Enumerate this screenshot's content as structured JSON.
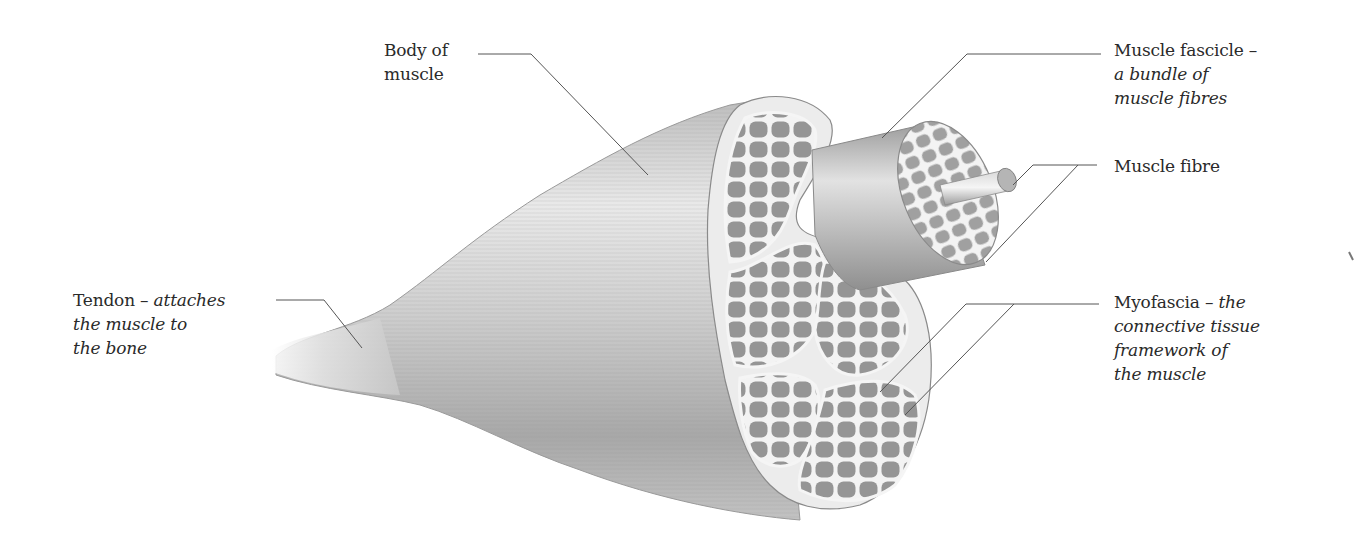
{
  "diagram": {
    "colors": {
      "background": "#ffffff",
      "text": "#2a2a2a",
      "leader_line": "#555555",
      "muscle_dark": "#8a8a8a",
      "muscle_light": "#e6e6e6",
      "fibre_fill": "#9c9c9c",
      "fascia": "#f1f1f1"
    },
    "labels": {
      "body": {
        "line1": "Body of",
        "line2": "muscle"
      },
      "fascicle": {
        "term": "Muscle fascicle –",
        "desc1": "a bundle of",
        "desc2": "muscle fibres"
      },
      "fibre": {
        "term": "Muscle fibre"
      },
      "tendon": {
        "term": "Tendon – ",
        "desc0": "attaches",
        "desc1": "the muscle to",
        "desc2": "the bone"
      },
      "myofascia": {
        "term": "Myofascia – ",
        "desc0": "the",
        "desc1": "connective tissue",
        "desc2": "framework of",
        "desc3": "the muscle"
      }
    },
    "leaders": [
      {
        "name": "body-leader",
        "points": [
          [
            478,
            54
          ],
          [
            531,
            54
          ],
          [
            648,
            175
          ]
        ]
      },
      {
        "name": "fascicle-leader",
        "points": [
          [
            1101,
            54
          ],
          [
            967,
            54
          ],
          [
            882,
            138
          ]
        ]
      },
      {
        "name": "fibre-leader-a",
        "points": [
          [
            1097,
            165
          ],
          [
            1033,
            165
          ],
          [
            1013,
            185
          ]
        ]
      },
      {
        "name": "fibre-leader-b",
        "points": [
          [
            1078,
            165
          ],
          [
            986,
            262
          ]
        ]
      },
      {
        "name": "tendon-leader",
        "points": [
          [
            276,
            300
          ],
          [
            324,
            300
          ],
          [
            362,
            348
          ]
        ]
      },
      {
        "name": "myofascia-leader-a",
        "points": [
          [
            1099,
            304
          ],
          [
            966,
            304
          ],
          [
            880,
            392
          ]
        ]
      },
      {
        "name": "myofascia-leader-b",
        "points": [
          [
            1014,
            304
          ],
          [
            905,
            415
          ]
        ]
      }
    ]
  }
}
